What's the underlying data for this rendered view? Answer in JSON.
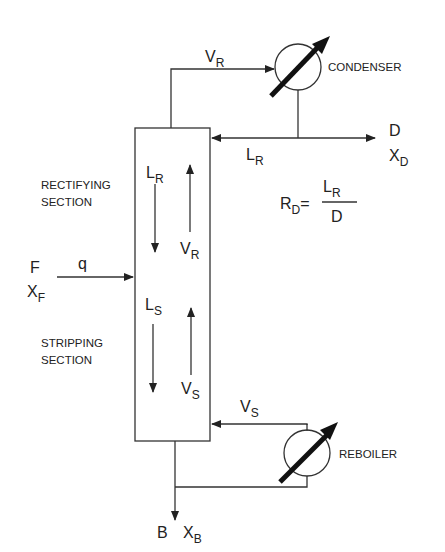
{
  "diagram": {
    "labels": {
      "condenser": "CONDENSER",
      "reboiler": "REBOILER",
      "rectifying": [
        "RECTIFYING",
        "SECTION"
      ],
      "stripping": [
        "STRIPPING",
        "SECTION"
      ]
    },
    "streams": {
      "vapor_top": {
        "main": "V",
        "sub": "R"
      },
      "reflux": {
        "main": "L",
        "sub": "R"
      },
      "distillate": {
        "main": "D"
      },
      "distillate_comp": {
        "main": "X",
        "sub": "D"
      },
      "feed": {
        "main": "F"
      },
      "feed_comp": {
        "main": "X",
        "sub": "F"
      },
      "feed_quality": "q",
      "liquid_rect": {
        "main": "L",
        "sub": "R"
      },
      "vapor_rect": {
        "main": "V",
        "sub": "R"
      },
      "liquid_strip": {
        "main": "L",
        "sub": "S"
      },
      "vapor_strip": {
        "main": "V",
        "sub": "S"
      },
      "boilup": {
        "main": "V",
        "sub": "S"
      },
      "bottoms": {
        "main": "B"
      },
      "bottoms_comp": {
        "main": "X",
        "sub": "B"
      }
    },
    "equation": {
      "lhs_main": "R",
      "lhs_sub": "D",
      "equals": "=",
      "num_main": "L",
      "num_sub": "R",
      "den": "D"
    }
  }
}
